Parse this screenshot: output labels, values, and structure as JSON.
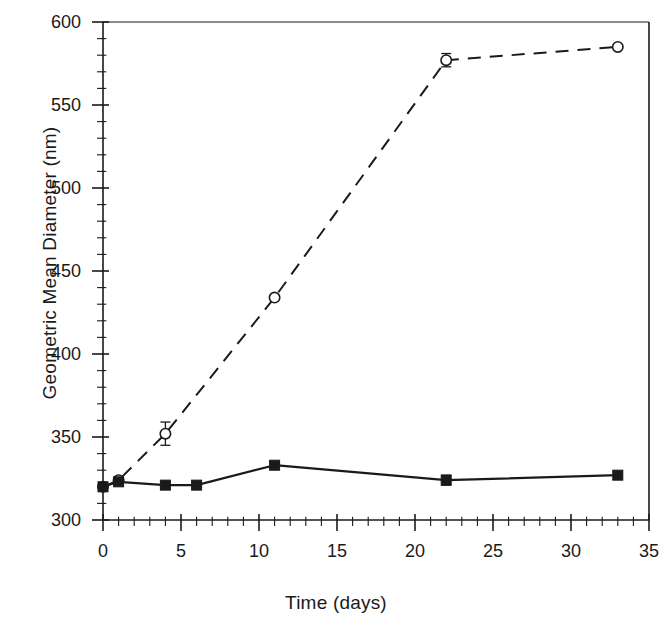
{
  "chart_data": {
    "type": "line",
    "title": "",
    "subtitle": "",
    "xlabel": "Time (days)",
    "ylabel": "Geometric Mean Diameter (nm)",
    "xlim": [
      0,
      35
    ],
    "ylim": [
      300,
      600
    ],
    "x_major_ticks": [
      0,
      5,
      10,
      15,
      20,
      25,
      30,
      35
    ],
    "x_tick_labels": [
      "0",
      "5",
      "10",
      "15",
      "20",
      "25",
      "30",
      "35"
    ],
    "x_minor_step": 1,
    "y_major_ticks": [
      300,
      350,
      400,
      450,
      500,
      550,
      600
    ],
    "y_tick_labels": [
      "300",
      "350",
      "400",
      "450",
      "500",
      "550",
      "600"
    ],
    "y_minor_step": 10,
    "grid": false,
    "legend": null,
    "legend_position": "none",
    "series": [
      {
        "name": "open-circle-dashed",
        "marker": "open-circle",
        "linestyle": "dashed",
        "color": "#1a1a1a",
        "x": [
          0,
          1,
          4,
          11,
          22,
          33
        ],
        "values": [
          320,
          324,
          352,
          434,
          577,
          585
        ],
        "yerr": [
          0,
          0,
          7,
          0,
          4,
          0
        ]
      },
      {
        "name": "filled-square-solid",
        "marker": "filled-square",
        "linestyle": "solid",
        "color": "#1a1a1a",
        "x": [
          0,
          1,
          4,
          6,
          11,
          22,
          33
        ],
        "values": [
          320,
          323,
          321,
          321,
          333,
          324,
          327
        ],
        "yerr": [
          0,
          0,
          0,
          0,
          0,
          3,
          2
        ]
      }
    ]
  },
  "figure": {
    "background_color": "#ffffff",
    "axis_color": "#1a1a1a",
    "text_color": "#1a1a1a"
  }
}
